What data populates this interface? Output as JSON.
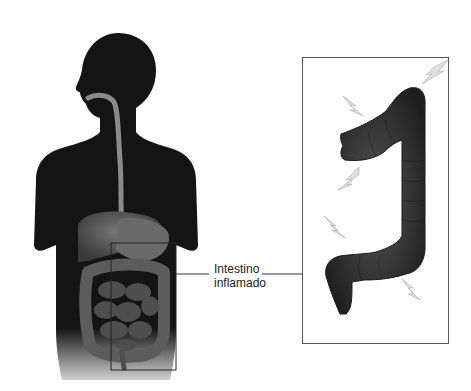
{
  "diagram": {
    "type": "medical-illustration",
    "label": {
      "line1": "Intestino",
      "line2": "inflamado"
    },
    "elements": {
      "body_silhouette": "human-torso-silhouette",
      "esophagus": "esophagus",
      "stomach": "stomach",
      "liver": "liver",
      "small_intestine": "small-intestine",
      "large_intestine": "large-intestine",
      "highlight_box": "zoom-region-box",
      "detail_panel": "inflamed-colon-detail",
      "pain_symbols": [
        "lightning-bolt",
        "lightning-bolt",
        "lightning-bolt",
        "lightning-bolt",
        "lightning-bolt",
        "lightning-bolt"
      ]
    },
    "colors": {
      "silhouette": "#141414",
      "organ": "#5a5a5a",
      "colon": "#2e2e2e",
      "bolt": "#d8d8d8",
      "frame": "#333333",
      "background": "#ffffff"
    }
  }
}
